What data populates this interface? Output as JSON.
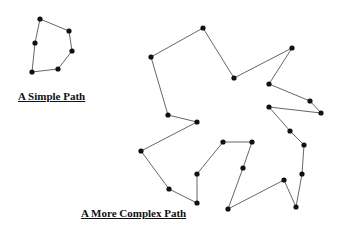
{
  "diagram": {
    "simple_path": {
      "caption": "A Simple Path",
      "points": [
        [
          40,
          19
        ],
        [
          69,
          31
        ],
        [
          72,
          51
        ],
        [
          58,
          69
        ],
        [
          32,
          72
        ],
        [
          35,
          43
        ]
      ],
      "closed": true
    },
    "complex_path": {
      "caption": "A More Complex  Path",
      "points": [
        [
          151,
          57
        ],
        [
          203,
          28
        ],
        [
          234,
          78
        ],
        [
          292,
          48
        ],
        [
          269,
          84
        ],
        [
          310,
          101
        ],
        [
          321,
          113
        ],
        [
          269,
          107
        ],
        [
          290,
          131
        ],
        [
          304,
          145
        ],
        [
          302,
          174
        ],
        [
          296,
          207
        ],
        [
          284,
          180
        ],
        [
          228,
          209
        ],
        [
          243,
          168
        ],
        [
          252,
          142
        ],
        [
          223,
          142
        ],
        [
          197,
          174
        ],
        [
          197,
          203
        ],
        [
          169,
          189
        ],
        [
          141,
          151
        ],
        [
          197,
          122
        ],
        [
          168,
          115
        ]
      ],
      "closed": true
    },
    "colors": {
      "line": "#555555",
      "node": "#111111"
    }
  }
}
